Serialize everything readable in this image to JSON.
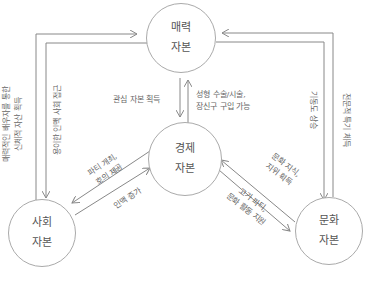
{
  "nodes": {
    "attractive": {
      "line1": "매력",
      "line2": "자본"
    },
    "economic": {
      "line1": "경제",
      "line2": "자본"
    },
    "social": {
      "line1": "사회",
      "line2": "자본"
    },
    "cultural": {
      "line1": "문화",
      "line2": "자본"
    }
  },
  "edges": {
    "social_to_attractive": {
      "line1": "매력적인 배우자를 통한",
      "line2": "신체적 자산 획득"
    },
    "attractive_to_social": {
      "line1": "용이한 인맥 사회 접근"
    },
    "attractive_to_economic": {
      "line1": "관심 자본 획득"
    },
    "economic_to_attractive": {
      "line1": "성형 수술/시술,",
      "line2": "장신구 구입 가능"
    },
    "economic_to_social": {
      "line1": "파티 개최,",
      "line2": "호의 제공"
    },
    "social_to_economic": {
      "line1": "인맥 증가"
    },
    "cultural_to_economic": {
      "line1": "문화 지식,",
      "line2": "지위 획득"
    },
    "economic_to_cultural": {
      "line1": "고가 파티,",
      "line2": "문화 활동 지원"
    },
    "attractive_to_cultural": {
      "line1": "기동도 상승"
    },
    "cultural_to_attractive": {
      "line1": "전문적 특기 체득"
    }
  },
  "colors": {
    "line": "#888888",
    "text": "#555555",
    "circle_border": "#aaaaaa"
  }
}
